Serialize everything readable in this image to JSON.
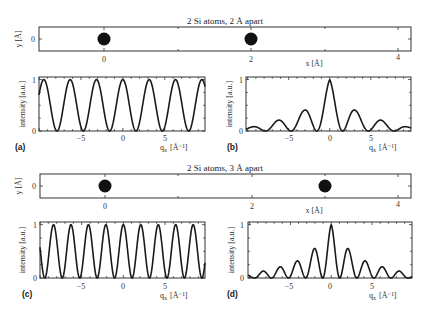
{
  "chart_data": [
    {
      "id": "top-structure",
      "type": "scatter",
      "title": "2 Si atoms, 2 Å apart",
      "xlabel": "x  [Å]",
      "ylabel": "y  [Å]",
      "xticks": [
        "0",
        "2",
        "4"
      ],
      "yticks": [
        "0"
      ],
      "points": [
        {
          "x": 0,
          "y": 0
        },
        {
          "x": 2,
          "y": 0
        }
      ],
      "xlim": [
        -0.9,
        4.2
      ]
    },
    {
      "id": "panel-a",
      "type": "line",
      "panel_label": "(a)",
      "xlabel": "q_x  [Å⁻¹]",
      "ylabel": "intensity [a.u.]",
      "xticks": [
        "−5",
        "0",
        "5"
      ],
      "yticks": [
        "0",
        "1"
      ],
      "xlim": [
        -10,
        9.8
      ],
      "ylim": [
        0,
        1.05
      ],
      "function": "cos^2(q*d/2), d = 2 Å",
      "peak_positions": [
        -9.42,
        -6.28,
        -3.14,
        0,
        3.14,
        6.28,
        9.42
      ],
      "peak_values": [
        1,
        1,
        1,
        1,
        1,
        1,
        1
      ]
    },
    {
      "id": "panel-b",
      "type": "line",
      "panel_label": "(b)",
      "xlabel": "q_x  [Å⁻¹]",
      "ylabel": "intensity [a.u.]",
      "xticks": [
        "−5",
        "0",
        "5"
      ],
      "yticks": [
        "0",
        "1"
      ],
      "xlim": [
        -10.2,
        9.9
      ],
      "ylim": [
        0,
        1.05
      ],
      "function": "form-factor envelope × cos^2(q*d/2), d = 2 Å",
      "peak_positions": [
        -9.42,
        -6.28,
        -3.14,
        0,
        3.14,
        6.28,
        9.42
      ],
      "peak_values": [
        0.08,
        0.2,
        0.4,
        1,
        0.4,
        0.2,
        0.08
      ]
    },
    {
      "id": "bottom-structure",
      "type": "scatter",
      "title": "2 Si atoms, 3 Å apart",
      "xlabel": "x  [Å]",
      "ylabel": "y  [Å]",
      "xticks": [
        "0",
        "2",
        "4"
      ],
      "yticks": [
        "0"
      ],
      "points": [
        {
          "x": 0,
          "y": 0
        },
        {
          "x": 3,
          "y": 0
        }
      ],
      "xlim": [
        -0.9,
        4.2
      ]
    },
    {
      "id": "panel-c",
      "type": "line",
      "panel_label": "(c)",
      "xlabel": "q_x  [Å⁻¹]",
      "ylabel": "intensity [a.u.]",
      "xticks": [
        "−5",
        "0",
        "5"
      ],
      "yticks": [
        "0",
        "1"
      ],
      "xlim": [
        -10,
        9.8
      ],
      "ylim": [
        0,
        1.05
      ],
      "function": "cos^2(q*d/2), d = 3 Å",
      "peak_positions": [
        -8.38,
        -6.28,
        -4.19,
        -2.09,
        0,
        2.09,
        4.19,
        6.28,
        8.38
      ],
      "peak_values": [
        1,
        1,
        1,
        1,
        1,
        1,
        1,
        1,
        1
      ]
    },
    {
      "id": "panel-d",
      "type": "line",
      "panel_label": "(d)",
      "xlabel": "q_x  [Å⁻¹]",
      "ylabel": "intensity [a.u.]",
      "xticks": [
        "−5",
        "0",
        "5"
      ],
      "yticks": [
        "0",
        "1"
      ],
      "xlim": [
        -10.2,
        9.9
      ],
      "ylim": [
        0,
        1.05
      ],
      "function": "form-factor envelope × cos^2(q*d/2), d = 3 Å",
      "peak_positions": [
        -8.38,
        -6.28,
        -4.19,
        -2.09,
        0,
        2.09,
        4.19,
        6.28,
        8.38
      ],
      "peak_values": [
        0.13,
        0.22,
        0.32,
        0.55,
        1,
        0.55,
        0.32,
        0.22,
        0.13
      ]
    }
  ],
  "envelope_samples": {
    "q": [
      0,
      2.09,
      3.14,
      4.19,
      6.28,
      8.38,
      9.42,
      10.5
    ],
    "val": [
      1,
      0.55,
      0.4,
      0.32,
      0.21,
      0.13,
      0.08,
      0.06
    ]
  },
  "labels": {
    "title_top": "2 Si atoms, 2 Å apart",
    "title_bottom": "2 Si atoms, 3 Å apart",
    "x_struct": "x  [Å]",
    "y_struct": "y  [Å]",
    "y_intensity": "intensity [a.u.]",
    "x_q": "q",
    "x_q_sub": "x",
    "x_q_unit": "[Å⁻¹]",
    "panel_a": "(a)",
    "panel_b": "(b)",
    "panel_c": "(c)",
    "panel_d": "(d)",
    "tick_0": "0",
    "tick_1": "1",
    "tick_2": "2",
    "tick_4": "4",
    "tick_m5": "−5",
    "tick_5": "5"
  }
}
